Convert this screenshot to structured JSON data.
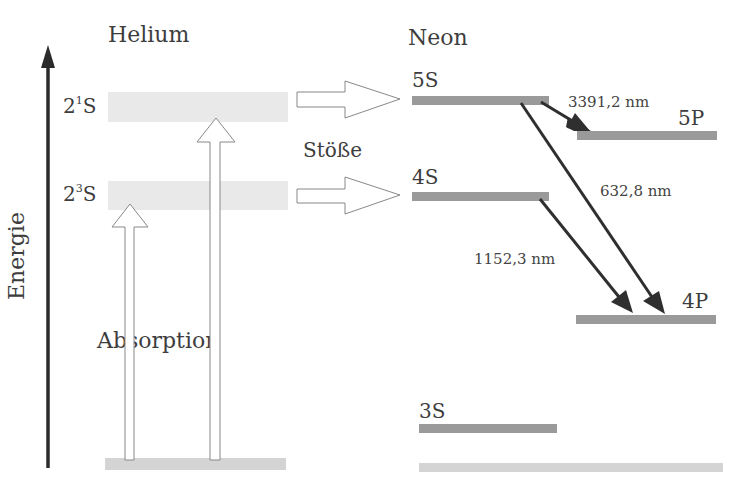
{
  "axis": {
    "label": "Energie",
    "direction": "up",
    "color": "#2b2b2b"
  },
  "helium": {
    "header": "Helium",
    "levels": [
      {
        "id": "2-1S",
        "base": "2",
        "sup": "1",
        "term": "S"
      },
      {
        "id": "2-3S",
        "base": "2",
        "sup": "3",
        "term": "S"
      },
      {
        "id": "ground",
        "label": ""
      }
    ],
    "process_label": "Absorption"
  },
  "transfer": {
    "label": "Stöße",
    "arrows": [
      "2¹S → 5S",
      "2³S → 4S"
    ]
  },
  "neon": {
    "header": "Neon",
    "levels": [
      {
        "id": "5S",
        "label": "5S"
      },
      {
        "id": "4S",
        "label": "4S"
      },
      {
        "id": "5P",
        "label": "5P"
      },
      {
        "id": "4P",
        "label": "4P"
      },
      {
        "id": "3S",
        "label": "3S"
      },
      {
        "id": "ground",
        "label": ""
      }
    ],
    "transitions": [
      {
        "from": "5S",
        "to": "5P",
        "wavelength": "3391,2 nm"
      },
      {
        "from": "5S",
        "to": "4P",
        "wavelength": "632,8 nm"
      },
      {
        "from": "4S",
        "to": "4P",
        "wavelength": "1152,3 nm"
      }
    ]
  },
  "colors": {
    "helium_band": "#e9e9e9",
    "neon_band": "#9a9a9a",
    "ground_band": "#d4d4d4",
    "arrow_dark": "#2f2f2f",
    "hollow_arrow_stroke": "#888888"
  }
}
